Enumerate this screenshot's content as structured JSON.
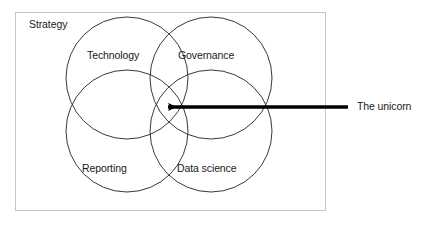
{
  "figure": {
    "type": "venn-diagram",
    "container_label": "Strategy",
    "border_color": "#c8c8c8",
    "background_color": "#ffffff",
    "circle_stroke_color": "#222222",
    "arrow_color": "#000000",
    "text_color": "#1a1a1a"
  },
  "circles": [
    {
      "id": "technology",
      "label": "Technology",
      "cx": 127,
      "cy": 78,
      "r": 61
    },
    {
      "id": "governance",
      "label": "Governance",
      "cx": 211,
      "cy": 78,
      "r": 61
    },
    {
      "id": "reporting",
      "label": "Reporting",
      "cx": 127,
      "cy": 131,
      "r": 61
    },
    {
      "id": "datascience",
      "label": "Data science",
      "cx": 211,
      "cy": 131,
      "r": 61
    }
  ],
  "annotation": {
    "arrow_label": "The unicorn",
    "arrow_points_to": "center intersection of all four circles",
    "arrow_tail_x": 348,
    "arrow_tip_x": 163,
    "arrow_y": 107
  },
  "icons": {
    "arrow": "arrow-left-icon"
  }
}
